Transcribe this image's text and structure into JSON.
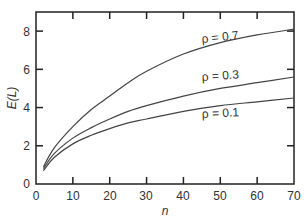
{
  "chart_data": {
    "type": "line",
    "title": "",
    "xlabel": "n",
    "ylabel": "E(L)",
    "xlim": [
      0,
      70
    ],
    "ylim": [
      0,
      9
    ],
    "grid": false,
    "legend": "inline curve labels",
    "x_ticks": [
      0,
      10,
      20,
      30,
      40,
      50,
      60,
      70
    ],
    "y_ticks": [
      0,
      2,
      4,
      6,
      8
    ],
    "x": [
      2,
      5,
      10,
      15,
      20,
      25,
      30,
      40,
      50,
      60,
      70
    ],
    "series": [
      {
        "name": "ρ = 0.7",
        "values": [
          0.9,
          1.9,
          3.0,
          3.9,
          4.6,
          5.3,
          5.9,
          6.8,
          7.4,
          7.8,
          8.1
        ]
      },
      {
        "name": "ρ = 0.3",
        "values": [
          0.8,
          1.6,
          2.4,
          2.95,
          3.4,
          3.8,
          4.1,
          4.6,
          5.0,
          5.3,
          5.6
        ]
      },
      {
        "name": "ρ = 0.1",
        "values": [
          0.7,
          1.4,
          2.1,
          2.55,
          2.9,
          3.2,
          3.4,
          3.8,
          4.1,
          4.3,
          4.5
        ]
      }
    ]
  },
  "labels": {
    "x_axis": "n",
    "y_axis": "E(L)",
    "curve_07": "ρ = 0.7",
    "curve_03": "ρ = 0.3",
    "curve_01": "ρ = 0.1",
    "ticks_x": [
      "0",
      "10",
      "20",
      "30",
      "40",
      "50",
      "60",
      "70"
    ],
    "ticks_y": [
      "0",
      "2",
      "4",
      "6",
      "8"
    ]
  }
}
